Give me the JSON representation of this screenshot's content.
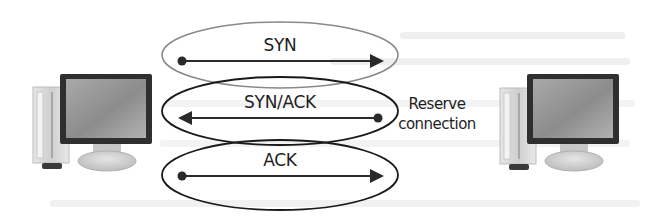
{
  "diagram": {
    "type": "tcp-three-way-handshake",
    "nodes": [
      {
        "id": "client",
        "icon": "desktop-computer-icon",
        "position": "left"
      },
      {
        "id": "server",
        "icon": "desktop-computer-icon",
        "position": "right"
      }
    ],
    "messages": [
      {
        "label": "SYN",
        "direction": "left-to-right",
        "ellipse_color": "#8a8a8a"
      },
      {
        "label": "SYN/ACK",
        "direction": "right-to-left",
        "ellipse_color": "#1a1a1a"
      },
      {
        "label": "ACK",
        "direction": "left-to-right",
        "ellipse_color": "#1a1a1a"
      }
    ],
    "annotation": {
      "line1": "Reserve",
      "line2": "connection"
    },
    "colors": {
      "arrow": "#2a2a2a",
      "monitor_bezel": "#333333",
      "screen": "#9a9a9a",
      "tower": "#d8d8d8"
    }
  }
}
